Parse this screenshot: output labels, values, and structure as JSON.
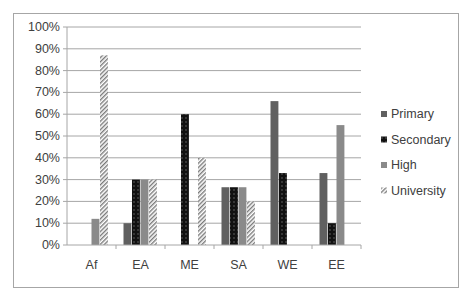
{
  "chart_data": {
    "type": "bar",
    "title": "",
    "xlabel": "",
    "ylabel": "",
    "ylim": [
      0,
      100
    ],
    "y_ticks": [
      "0%",
      "10%",
      "20%",
      "30%",
      "40%",
      "50%",
      "60%",
      "70%",
      "80%",
      "90%",
      "100%"
    ],
    "grid": true,
    "legend_position": "right",
    "categories": [
      "Af",
      "EA",
      "ME",
      "SA",
      "WE",
      "EE"
    ],
    "series": [
      {
        "name": "Primary",
        "values": [
          0,
          10,
          0,
          26.5,
          66,
          33
        ],
        "color": "#606060",
        "pattern": "solid"
      },
      {
        "name": "Secondary",
        "values": [
          0,
          30,
          60,
          26.5,
          33,
          10
        ],
        "color": "#111111",
        "pattern": "dots"
      },
      {
        "name": "High",
        "values": [
          12,
          30,
          0,
          26.5,
          0,
          55
        ],
        "color": "#8a8a8a",
        "pattern": "solid"
      },
      {
        "name": "University",
        "values": [
          87,
          30,
          40,
          20,
          0,
          0
        ],
        "color": "#7a7a7a",
        "pattern": "diagonal-hatch"
      }
    ]
  },
  "legend": {
    "items": [
      {
        "label": "Primary"
      },
      {
        "label": "Secondary"
      },
      {
        "label": "High"
      },
      {
        "label": "University"
      }
    ]
  }
}
